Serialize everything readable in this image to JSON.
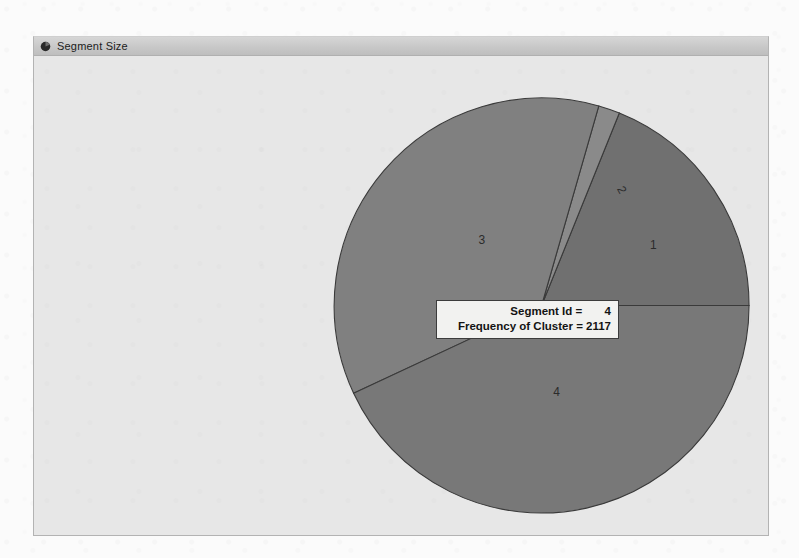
{
  "window": {
    "title": "Segment Size",
    "icon": "pie-chart-icon"
  },
  "tooltip": {
    "line1": "Segment Id =       4",
    "line2": "Frequency of Cluster = 2117"
  },
  "colors": {
    "desktop": "#fbfbfb",
    "window_frame": "#b3b3b3",
    "title_bar": "#c8c8c8",
    "client_area": "#e7e7e7",
    "slice_fill": "#808080",
    "slice_fill_alt": "#707070",
    "slice_outline": "#3a3a3a",
    "label_text": "#2b2b2b",
    "tooltip_bg": "#f2f2f0",
    "tooltip_border": "#3c3c3c"
  },
  "chart_data": {
    "type": "pie",
    "title": "Segment Size",
    "xlabel": "",
    "ylabel": "",
    "categories": [
      "1",
      "2",
      "3",
      "4"
    ],
    "values": [
      908,
      80,
      1735,
      2117
    ],
    "labels": [
      "1",
      "2",
      "3",
      "4"
    ],
    "start_angle_deg": 0,
    "direction": "counterclockwise",
    "slices": [
      {
        "label": "1",
        "segment_id": 1,
        "frequency": 908,
        "start_angle_deg": 0,
        "end_angle_deg": 68,
        "sweep_deg": 68,
        "color": "#707070",
        "label_x": 655,
        "label_y": 249
      },
      {
        "label": "2",
        "segment_id": 2,
        "frequency": 80,
        "start_angle_deg": 68,
        "end_angle_deg": 74,
        "sweep_deg": 6,
        "color": "#8a8a8a",
        "label_x": 620,
        "label_y": 192,
        "label_rotation_deg": 62
      },
      {
        "label": "3",
        "segment_id": 3,
        "frequency": 1735,
        "start_angle_deg": 74,
        "end_angle_deg": 205,
        "sweep_deg": 131,
        "color": "#808080",
        "label_x": 483,
        "label_y": 244
      },
      {
        "label": "4",
        "segment_id": 4,
        "frequency": 2117,
        "start_angle_deg": 205,
        "end_angle_deg": 360,
        "sweep_deg": 155,
        "color": "#787878",
        "label_x": 558,
        "label_y": 397,
        "selected": true
      }
    ],
    "center": {
      "x": 543,
      "y": 306
    },
    "radius": 208,
    "total": 4840,
    "legend": "none",
    "grid": false
  }
}
